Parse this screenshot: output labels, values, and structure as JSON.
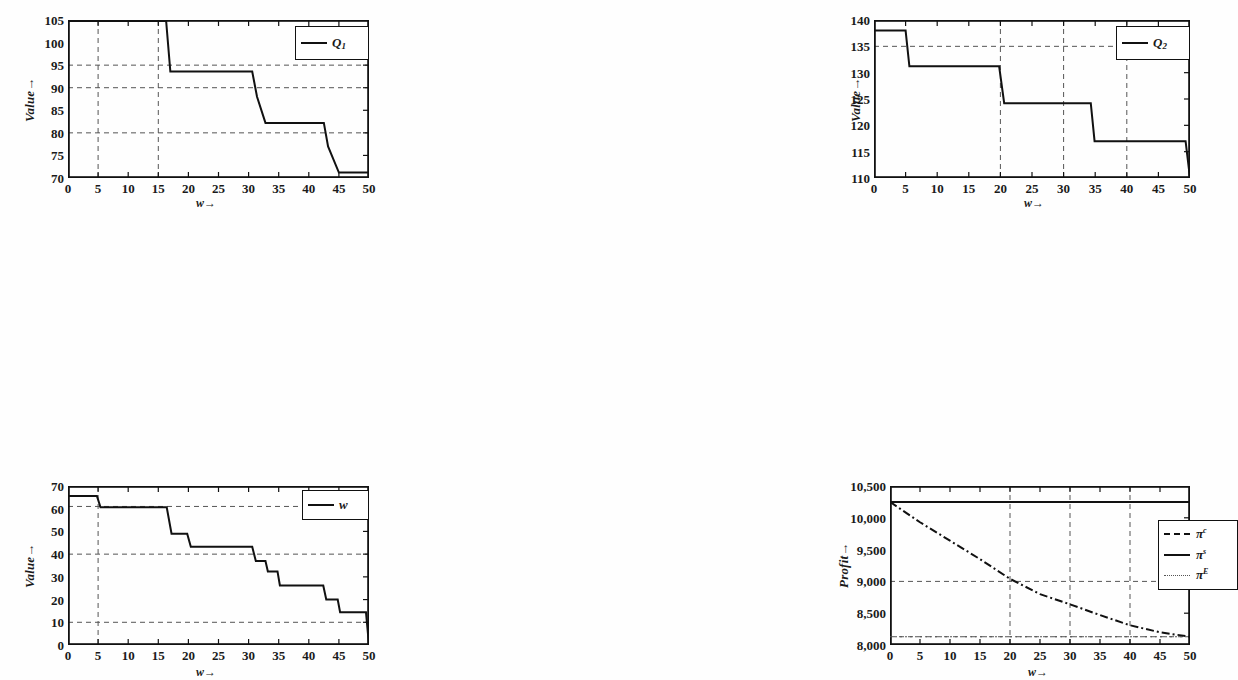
{
  "figure": {
    "background": "#fefefe",
    "line_color": "#111111",
    "grid_color": "#555555",
    "caption": ""
  },
  "chart_data": [
    {
      "id": "q1",
      "type": "line",
      "title": "",
      "xlabel": "w→",
      "ylabel": "Value→",
      "xlim": [
        0,
        50
      ],
      "ylim": [
        70,
        105
      ],
      "xticks": [
        0,
        5,
        10,
        15,
        20,
        25,
        30,
        35,
        40,
        45,
        50
      ],
      "yticks": [
        70,
        75,
        80,
        85,
        90,
        95,
        100,
        105
      ],
      "grid": true,
      "grid_x": [
        5,
        15
      ],
      "grid_y": [
        80,
        90,
        95
      ],
      "legend_position": "top-right",
      "series": [
        {
          "name": "Q1",
          "label": "Q",
          "sub": "1",
          "style": "solid",
          "x": [
            0,
            16.3,
            16.3,
            17.0,
            17.0,
            30.6,
            30.6,
            31.4,
            31.4,
            32.8,
            32.8,
            42.5,
            42.5,
            43.2,
            43.2,
            45.0,
            45.0,
            50
          ],
          "y": [
            104.8,
            104.8,
            104.8,
            93.6,
            93.6,
            93.6,
            93.6,
            88.0,
            88.0,
            82.2,
            82.2,
            82.2,
            82.2,
            77.0,
            77.0,
            71.2,
            71.2,
            71.2
          ],
          "steps": [
            {
              "from": 0,
              "to": 16.3,
              "value": 104.8
            },
            {
              "from": 17.0,
              "to": 30.6,
              "value": 93.6
            },
            {
              "from": 31.4,
              "to": 32.8,
              "value": 88.0
            },
            {
              "from": 32.8,
              "to": 42.5,
              "value": 82.2
            },
            {
              "from": 43.2,
              "to": 45.0,
              "value": 77.0
            },
            {
              "from": 45.0,
              "to": 50,
              "value": 71.2
            }
          ]
        }
      ]
    },
    {
      "id": "q2",
      "type": "line",
      "title": "",
      "xlabel": "w→",
      "ylabel": "Value→",
      "xlim": [
        0,
        50
      ],
      "ylim": [
        110,
        140
      ],
      "xticks": [
        0,
        5,
        10,
        15,
        20,
        25,
        30,
        35,
        40,
        45,
        50
      ],
      "yticks": [
        110,
        115,
        120,
        125,
        130,
        135,
        140
      ],
      "grid": true,
      "grid_x": [
        20,
        30,
        40
      ],
      "grid_y": [
        135
      ],
      "legend_position": "top-right",
      "series": [
        {
          "name": "Q2",
          "label": "Q",
          "sub": "2",
          "style": "solid",
          "x": [
            0,
            5.0,
            5.6,
            19.8,
            20.6,
            34.3,
            34.9,
            49.3,
            50.0
          ],
          "y": [
            138.0,
            138.0,
            131.2,
            131.2,
            124.2,
            124.2,
            117.0,
            117.0,
            110.0
          ],
          "steps": [
            {
              "from": 0,
              "to": 5.0,
              "value": 138.0
            },
            {
              "from": 5.6,
              "to": 19.8,
              "value": 131.2
            },
            {
              "from": 20.6,
              "to": 34.3,
              "value": 124.2
            },
            {
              "from": 34.9,
              "to": 49.3,
              "value": 117.0
            },
            {
              "from": 50.0,
              "to": 50.0,
              "value": 110.0
            }
          ]
        }
      ]
    },
    {
      "id": "w",
      "type": "line",
      "title": "",
      "xlabel": "w→",
      "ylabel": "Value→",
      "xlim": [
        0,
        50
      ],
      "ylim": [
        0,
        70
      ],
      "xticks": [
        0,
        5,
        10,
        15,
        20,
        25,
        30,
        35,
        40,
        45,
        50
      ],
      "yticks": [
        0,
        10,
        20,
        30,
        40,
        50,
        60,
        70
      ],
      "grid": true,
      "grid_x": [
        5
      ],
      "grid_y": [
        10,
        40,
        61
      ],
      "legend_position": "top-right",
      "series": [
        {
          "name": "w",
          "label": "w",
          "sub": "",
          "style": "solid",
          "x": [
            0,
            4.8,
            5.4,
            16.4,
            17.2,
            19.8,
            20.4,
            30.6,
            31.2,
            32.8,
            33.2,
            34.8,
            35.2,
            42.4,
            42.9,
            44.8,
            45.2,
            49.5,
            50
          ],
          "y": [
            65.6,
            65.6,
            60.6,
            60.6,
            49.0,
            49.0,
            43.2,
            43.2,
            37.0,
            37.0,
            32.4,
            32.4,
            26.2,
            26.2,
            20.0,
            20.0,
            14.4,
            14.4,
            0
          ],
          "steps": [
            {
              "from": 0,
              "to": 4.8,
              "value": 65.6
            },
            {
              "from": 5.4,
              "to": 16.4,
              "value": 60.6
            },
            {
              "from": 17.2,
              "to": 19.8,
              "value": 49.0
            },
            {
              "from": 20.4,
              "to": 30.6,
              "value": 43.2
            },
            {
              "from": 31.2,
              "to": 32.8,
              "value": 37.0
            },
            {
              "from": 33.2,
              "to": 34.8,
              "value": 32.4
            },
            {
              "from": 35.2,
              "to": 42.4,
              "value": 26.2
            },
            {
              "from": 42.9,
              "to": 44.8,
              "value": 20.0
            },
            {
              "from": 45.2,
              "to": 49.5,
              "value": 14.4
            }
          ]
        }
      ]
    },
    {
      "id": "profit",
      "type": "line",
      "title": "",
      "xlabel": "w→",
      "ylabel": "Profit→",
      "xlim": [
        0,
        50
      ],
      "ylim": [
        8000,
        10500
      ],
      "xticks": [
        0,
        5,
        10,
        15,
        20,
        25,
        30,
        35,
        40,
        45,
        50
      ],
      "yticks": [
        8000,
        8500,
        9000,
        9500,
        10000,
        10500
      ],
      "ytick_labels": [
        "8,000",
        "8,500",
        "9,000",
        "9,500",
        "10,000",
        "10,500"
      ],
      "grid": true,
      "grid_x": [
        20,
        30,
        40
      ],
      "grid_y": [
        8130,
        9000
      ],
      "legend_position": "middle-right",
      "series": [
        {
          "name": "pi_c",
          "label": "π",
          "sup": "c",
          "style": "dashdot",
          "x": [
            0,
            5,
            10,
            15,
            20,
            25,
            30,
            35,
            40,
            45,
            50
          ],
          "y": [
            10250,
            9930,
            9640,
            9350,
            9040,
            8800,
            8640,
            8470,
            8310,
            8200,
            8130
          ]
        },
        {
          "name": "pi_s",
          "label": "π",
          "sup": "s",
          "style": "solid",
          "x": [
            0,
            50
          ],
          "y": [
            10250,
            10250
          ]
        },
        {
          "name": "pi_E",
          "label": "π",
          "sup": "E",
          "style": "dotted",
          "x": [
            0,
            50
          ],
          "y": [
            8130,
            8130
          ]
        }
      ]
    }
  ]
}
